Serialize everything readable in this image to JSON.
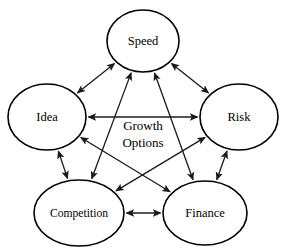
{
  "diagram": {
    "title": "Growth Options",
    "center_label": {
      "line1": "Growth",
      "line2": "Options"
    },
    "background_color": "#ffffff",
    "stroke_color": "#000000",
    "node_fill_color": "#ffffff",
    "nodes": [
      {
        "id": "speed",
        "label": "Speed",
        "cx": 143,
        "cy": 41,
        "rx": 36,
        "ry": 31
      },
      {
        "id": "idea",
        "label": "Idea",
        "cx": 47,
        "cy": 117,
        "rx": 39,
        "ry": 33
      },
      {
        "id": "risk",
        "label": "Risk",
        "cx": 239,
        "cy": 117,
        "rx": 39,
        "ry": 33
      },
      {
        "id": "competition",
        "label": "Competition",
        "cx": 79,
        "cy": 213,
        "rx": 45,
        "ry": 33
      },
      {
        "id": "finance",
        "label": "Finance",
        "cx": 205,
        "cy": 213,
        "rx": 42,
        "ry": 32
      }
    ],
    "edges": [
      {
        "id": "speed-idea",
        "from": "speed",
        "to": "idea",
        "arrows": "both"
      },
      {
        "id": "speed-risk",
        "from": "speed",
        "to": "risk",
        "arrows": "both"
      },
      {
        "id": "speed-competition",
        "from": "speed",
        "to": "competition",
        "arrows": "both"
      },
      {
        "id": "speed-finance",
        "from": "speed",
        "to": "finance",
        "arrows": "both"
      },
      {
        "id": "idea-risk",
        "from": "idea",
        "to": "risk",
        "arrows": "both"
      },
      {
        "id": "idea-competition",
        "from": "idea",
        "to": "competition",
        "arrows": "both"
      },
      {
        "id": "idea-finance",
        "from": "idea",
        "to": "finance",
        "arrows": "both"
      },
      {
        "id": "risk-competition",
        "from": "risk",
        "to": "competition",
        "arrows": "both"
      },
      {
        "id": "risk-finance",
        "from": "risk",
        "to": "finance",
        "arrows": "both"
      },
      {
        "id": "competition-finance",
        "from": "competition",
        "to": "finance",
        "arrows": "both"
      }
    ]
  }
}
